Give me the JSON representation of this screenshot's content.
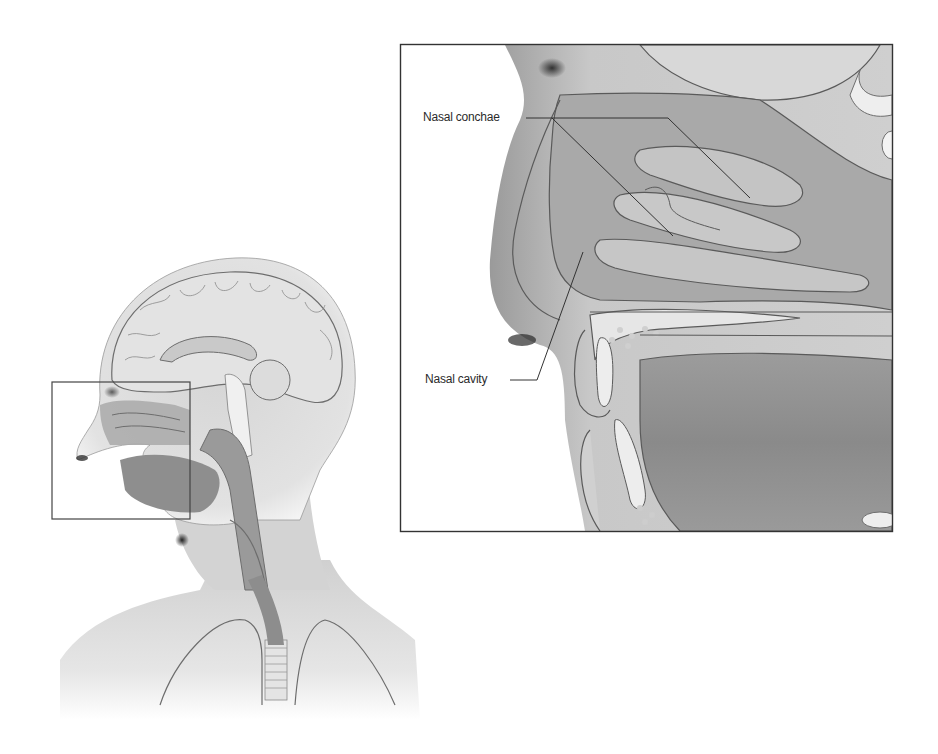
{
  "figure": {
    "overview": {
      "region": "head-and-neck",
      "highlight_box": "nose-region"
    },
    "inset": {
      "labels": [
        {
          "id": "nasal-conchae",
          "text": "Nasal conchae"
        },
        {
          "id": "nasal-cavity",
          "text": "Nasal cavity"
        }
      ]
    },
    "colors": {
      "background": "#ffffff",
      "skin": "#d9d9d9",
      "skin_dark": "#a8a8a8",
      "tissue": "#bdbdbd",
      "tissue_dark": "#8f8f8f",
      "bone_light": "#e8e8e8",
      "outline": "#5a5a5a",
      "frame": "#333333",
      "text": "#2b2b2b"
    }
  }
}
